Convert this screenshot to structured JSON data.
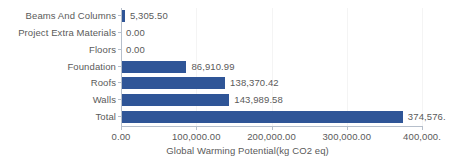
{
  "chart_data": {
    "type": "bar",
    "orientation": "horizontal",
    "title": "",
    "xlabel": "Global Warming Potential(kg CO2 eq)",
    "ylabel": "",
    "xlim": [
      0,
      420000
    ],
    "grid": true,
    "legend": false,
    "series_color": "#2f5597",
    "categories": [
      "Beams And Columns",
      "Project Extra Materials",
      "Floors",
      "Foundation",
      "Roofs",
      "Walls",
      "Total"
    ],
    "values": [
      5305.5,
      0.0,
      0.0,
      86910.99,
      138370.42,
      143989.58,
      374576.49
    ],
    "data_labels": [
      "5,305.50",
      "0.00",
      "0.00",
      "86,910.99",
      "138,370.42",
      "143,989.58",
      "374,576."
    ],
    "xticks": [
      0,
      100000,
      200000,
      300000,
      400000
    ],
    "xtick_labels": [
      "0.00",
      "100,000.00",
      "200,000.00",
      "300,000.00",
      "400,000."
    ]
  },
  "colors": {
    "bar": "#2f5597",
    "text": "#5a5a5a",
    "axis": "#b6bfcb",
    "gridline": "#f4f4f4",
    "background": "#ffffff"
  }
}
